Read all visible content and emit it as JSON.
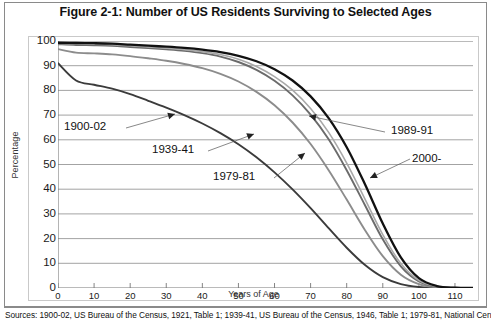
{
  "figure": {
    "title": "Figure 2-1: Number of US Residents Surviving to Selected Ages",
    "sources": "Sources: 1900-02, US Bureau of the Census, 1921, Table 1; 1939-41, US Bureau of the Census, 1946, Table 1; 1979-81, National Center for"
  },
  "chart_data": {
    "type": "line",
    "title": "Figure 2-1: Number of US Residents Surviving to Selected Ages",
    "xlabel": "Years of Age",
    "ylabel": "Percentage",
    "xlim": [
      0,
      115
    ],
    "ylim": [
      0,
      100
    ],
    "grid": true,
    "legend_position": "inline-annotations",
    "xticks": [
      0,
      10,
      20,
      30,
      40,
      50,
      60,
      70,
      80,
      90,
      100,
      110
    ],
    "yticks": [
      0,
      10,
      20,
      30,
      40,
      50,
      60,
      70,
      80,
      90,
      100
    ],
    "x": [
      0,
      5,
      10,
      15,
      20,
      25,
      30,
      35,
      40,
      45,
      50,
      55,
      60,
      65,
      70,
      75,
      80,
      85,
      90,
      95,
      100,
      105,
      110,
      115
    ],
    "series": [
      {
        "name": "1900-02",
        "color": "#3b3b3b",
        "width": 1.9,
        "values": [
          91.0,
          84.0,
          82.3,
          80.7,
          78.5,
          75.8,
          73.0,
          70.0,
          66.6,
          62.7,
          58.2,
          52.9,
          46.8,
          39.9,
          32.3,
          24.2,
          16.3,
          9.4,
          4.4,
          1.6,
          0.4,
          0.1,
          0.0,
          0.0
        ]
      },
      {
        "name": "1939-41",
        "color": "#8c8c8c",
        "width": 1.9,
        "values": [
          96.7,
          95.3,
          95.0,
          94.6,
          93.9,
          93.0,
          92.0,
          90.7,
          89.0,
          86.7,
          83.6,
          79.4,
          74.0,
          67.0,
          58.3,
          47.7,
          35.8,
          23.6,
          12.9,
          5.4,
          1.6,
          0.3,
          0.0,
          0.0
        ]
      },
      {
        "name": "1979-81",
        "color": "#6b6b6b",
        "width": 1.9,
        "values": [
          98.7,
          98.4,
          98.3,
          98.1,
          97.6,
          97.1,
          96.6,
          96.0,
          95.1,
          93.7,
          91.5,
          88.3,
          83.9,
          78.0,
          70.2,
          60.2,
          47.7,
          33.7,
          19.7,
          8.8,
          2.7,
          0.5,
          0.1,
          0.0
        ]
      },
      {
        "name": "1989-91",
        "color": "#a8a8a8",
        "width": 1.6,
        "values": [
          99.0,
          98.8,
          98.7,
          98.5,
          98.1,
          97.6,
          97.1,
          96.5,
          95.7,
          94.5,
          92.6,
          89.7,
          85.6,
          80.1,
          72.7,
          63.0,
          50.6,
          36.2,
          21.6,
          9.9,
          3.1,
          0.6,
          0.1,
          0.0
        ]
      },
      {
        "name": "2000-",
        "color": "#111111",
        "width": 2.3,
        "values": [
          99.3,
          99.2,
          99.1,
          98.9,
          98.5,
          98.1,
          97.7,
          97.2,
          96.5,
          95.5,
          94.0,
          91.8,
          88.6,
          84.0,
          77.6,
          68.8,
          57.0,
          42.2,
          26.1,
          12.4,
          4.0,
          0.8,
          0.1,
          0.0
        ]
      }
    ],
    "annotations": [
      {
        "text": "1900-02",
        "x_px": 64,
        "y_px": 120
      },
      {
        "text": "1939-41",
        "x_px": 152,
        "y_px": 143
      },
      {
        "text": "1979-81",
        "x_px": 213,
        "y_px": 170
      },
      {
        "text": "1989-91",
        "x_px": 391,
        "y_px": 124
      },
      {
        "text": "2000-",
        "x_px": 412,
        "y_px": 152
      }
    ]
  },
  "axis": {
    "y_title": "Percentage",
    "x_title": "Years of Age",
    "y_labels": [
      "100",
      "90",
      "80",
      "70",
      "60",
      "50",
      "40",
      "30",
      "20",
      "10",
      "0"
    ],
    "x_labels": [
      "0",
      "10",
      "20",
      "30",
      "40",
      "50",
      "60",
      "70",
      "80",
      "90",
      "100",
      "110"
    ]
  }
}
